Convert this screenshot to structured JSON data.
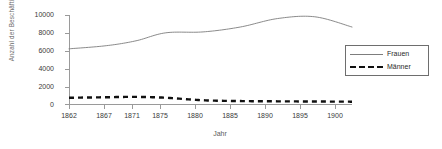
{
  "chart_data": {
    "type": "line",
    "title": "",
    "xlabel": "Jahr",
    "ylabel": "Anzahl der Beschäftigten",
    "xlim": [
      1862,
      1900
    ],
    "ylim": [
      0,
      10000
    ],
    "grid": false,
    "legend_position": "right",
    "xticks": [
      "1862",
      "1867",
      "1871",
      "1875",
      "1880",
      "1885",
      "1890",
      "1895",
      "1900"
    ],
    "xtick_values": [
      1862,
      1867,
      1871,
      1875,
      1880,
      1885,
      1890,
      1895,
      1900
    ],
    "yticks": [
      "0",
      "2000",
      "4000",
      "6000",
      "8000",
      "10000"
    ],
    "ytick_values": [
      0,
      2000,
      4000,
      6000,
      8000,
      10000
    ],
    "x": [
      1862,
      1867,
      1871,
      1875,
      1880,
      1885,
      1890,
      1895,
      1900
    ],
    "series": [
      {
        "name": "Frauen",
        "style": "solid",
        "color": "#7d7d7d",
        "values": [
          6200,
          6550,
          7100,
          8000,
          8100,
          8650,
          9600,
          9800,
          8650
        ]
      },
      {
        "name": "Männer",
        "style": "dashed",
        "color": "#101010",
        "values": [
          700,
          760,
          800,
          700,
          420,
          330,
          300,
          280,
          260
        ]
      }
    ]
  },
  "legend": {
    "entries": [
      {
        "label": "Frauen"
      },
      {
        "label": "Männer"
      }
    ]
  },
  "axes": {
    "y_title": "Anzahl der Beschäftigten",
    "x_title": "Jahr"
  }
}
